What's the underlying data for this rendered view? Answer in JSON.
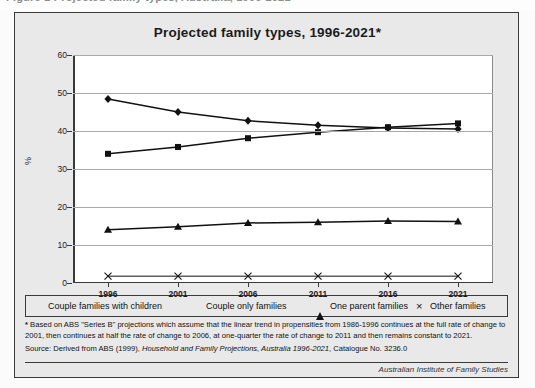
{
  "caption_strip": {
    "text": "Figure 1  Projected family types, Australia, 1996-2021"
  },
  "figure": {
    "title": "Projected family types, 1996-2021*",
    "credit": "Australian Institute of Family Studies"
  },
  "notes": {
    "star_marker": "*",
    "star_text": "Based on ABS \"Series B\" projections which assume that the linear trend in propensities from 1986-1996 continues at the full rate of change to 2001, then continues at half the rate of change to 2006, at one-quarter the rate of change to 2011 and then remains constant to 2021.",
    "source_prefix": "Source: Derived from ABS (1999), ",
    "source_italic": "Household and Family Projections, Australia 1996-2021",
    "source_suffix": ", Catalogue No. 3236.0"
  },
  "legend": {
    "items": [
      {
        "label": "Couple families with children",
        "marker": "diamond-icon"
      },
      {
        "label": "Couple only families",
        "marker": "square-icon"
      },
      {
        "label": "One parent families",
        "marker": "triangle-icon"
      },
      {
        "label": "Other families",
        "marker": "cross-icon"
      }
    ]
  },
  "chart_data": {
    "type": "line",
    "title": "Projected family types, 1996-2021*",
    "xlabel": "",
    "ylabel": "%",
    "categories": [
      "1996",
      "2001",
      "2006",
      "2011",
      "2016",
      "2021"
    ],
    "ylim": [
      0,
      60
    ],
    "yticks": [
      0,
      10,
      20,
      30,
      40,
      50,
      60
    ],
    "ytick_labels": [
      "0",
      "10",
      "20",
      "30",
      "40",
      "50",
      "60"
    ],
    "grid": true,
    "legend_position": "bottom",
    "series": [
      {
        "name": "Couple families with children",
        "marker": "diamond",
        "values": [
          48.4,
          45.0,
          42.7,
          41.5,
          40.8,
          40.5
        ]
      },
      {
        "name": "Couple only families",
        "marker": "square",
        "values": [
          34.0,
          35.8,
          38.1,
          39.7,
          41.0,
          42.0
        ]
      },
      {
        "name": "One parent families",
        "marker": "triangle",
        "values": [
          14.0,
          14.8,
          15.8,
          16.0,
          16.3,
          16.2
        ]
      },
      {
        "name": "Other families",
        "marker": "cross",
        "values": [
          1.8,
          1.8,
          1.8,
          1.8,
          1.8,
          1.8
        ]
      }
    ],
    "colors": {
      "series_line": "#111111",
      "gridline": "#a9a9a9",
      "axis": "#3a3a3a",
      "plot_bg": "#ffffff",
      "figure_bg": "#e9e9e9"
    }
  }
}
